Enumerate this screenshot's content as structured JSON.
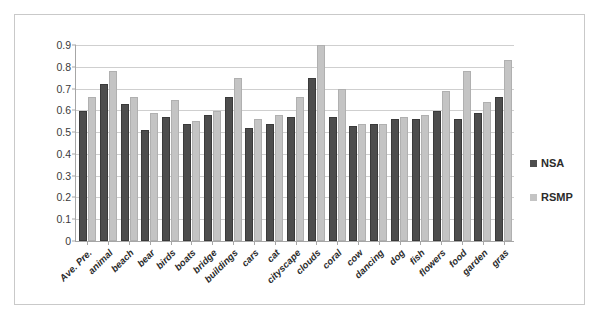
{
  "chart_data": {
    "type": "bar",
    "title": "",
    "xlabel": "",
    "ylabel": "",
    "ylim": [
      0,
      0.9
    ],
    "ytick_labels": [
      "0.9",
      "0.8",
      "0.7",
      "0.6",
      "0.5",
      "0.4",
      "0.3",
      "0.2",
      "0.1",
      "0"
    ],
    "ytick_values": [
      0.9,
      0.8,
      0.7,
      0.6,
      0.5,
      0.4,
      0.3,
      0.2,
      0.1,
      0
    ],
    "grid": true,
    "legend_position": "right",
    "categories": [
      "Ave. Pre.",
      "animal",
      "beach",
      "bear",
      "birds",
      "boats",
      "bridge",
      "buildings",
      "cars",
      "cat",
      "cityscape",
      "clouds",
      "coral",
      "cow",
      "dancing",
      "dog",
      "fish",
      "flowers",
      "food",
      "garden",
      "gras"
    ],
    "series": [
      {
        "name": "NSA",
        "color": "#4d4d4d",
        "values": [
          0.59,
          0.71,
          0.62,
          0.5,
          0.56,
          0.53,
          0.57,
          0.65,
          0.51,
          0.53,
          0.56,
          0.74,
          0.56,
          0.52,
          0.53,
          0.55,
          0.55,
          0.59,
          0.55,
          0.58,
          0.65
        ]
      },
      {
        "name": "RSMP",
        "color": "#c4c4c4",
        "values": [
          0.65,
          0.77,
          0.65,
          0.58,
          0.64,
          0.54,
          0.59,
          0.74,
          0.55,
          0.57,
          0.65,
          0.89,
          0.69,
          0.53,
          0.53,
          0.56,
          0.57,
          0.68,
          0.77,
          0.63,
          0.82
        ]
      }
    ]
  },
  "legend": {
    "items": [
      {
        "label": "NSA",
        "swatch_class": "nsa"
      },
      {
        "label": "RSMP",
        "swatch_class": "rsmp"
      }
    ]
  },
  "colors": {
    "nsa": "#4d4d4d",
    "rsmp": "#c4c4c4",
    "grid": "#cfcfcf",
    "axis": "#a6a6a6",
    "border": "#c9c9c9",
    "background": "#ffffff"
  }
}
